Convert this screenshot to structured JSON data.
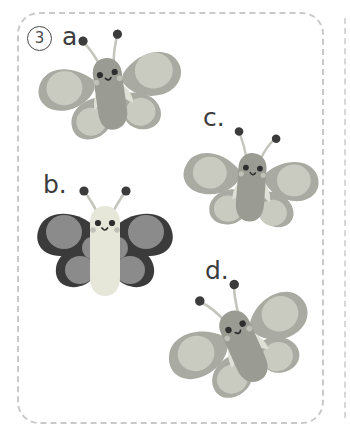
{
  "page": {
    "kind": "worksheet-panel",
    "question_number": "3",
    "background_color": "#ffffff"
  },
  "frame": {
    "style": "dashed",
    "border_color": "#c9c9c9",
    "corner_radius_px": 22,
    "edge_line_color": "#d8d8d8"
  },
  "number_badge": {
    "text": "3",
    "shape": "circle",
    "stroke_color": "#4a4a4a"
  },
  "palette": {
    "gray_wing": "#a9aba2",
    "gray_spot": "#c9cbc1",
    "gray_body": "#9a9c93",
    "dark_wing": "#3b3b3b",
    "dark_spot": "#8b8b8b",
    "pale_body": "#e6e7d9",
    "antenna_line": "#c4c6bd",
    "antenna_tip": "#3b3b3b",
    "eye": "#2e2e2e",
    "cheek": "#bfc1b7",
    "label_text": "#3c3c3c"
  },
  "options": [
    {
      "id": "a",
      "label": "a.",
      "shape": "butterfly",
      "color_group": "gray",
      "wing_color": "#a9aba2",
      "spot_color": "#c9cbc1",
      "body_color": "#9a9c93",
      "rotation_deg": -8,
      "odd_one_out": false
    },
    {
      "id": "b",
      "label": "b.",
      "shape": "butterfly",
      "color_group": "dark",
      "wing_color": "#3b3b3b",
      "spot_color": "#8b8b8b",
      "body_color": "#e6e7d9",
      "rotation_deg": 0,
      "odd_one_out": true
    },
    {
      "id": "c",
      "label": "c.",
      "shape": "butterfly",
      "color_group": "gray",
      "wing_color": "#a9aba2",
      "spot_color": "#c9cbc1",
      "body_color": "#9a9c93",
      "rotation_deg": 4,
      "odd_one_out": false
    },
    {
      "id": "d",
      "label": "d.",
      "shape": "butterfly",
      "color_group": "gray",
      "wing_color": "#a9aba2",
      "spot_color": "#c9cbc1",
      "body_color": "#9a9c93",
      "rotation_deg": -24,
      "odd_one_out": false
    }
  ]
}
